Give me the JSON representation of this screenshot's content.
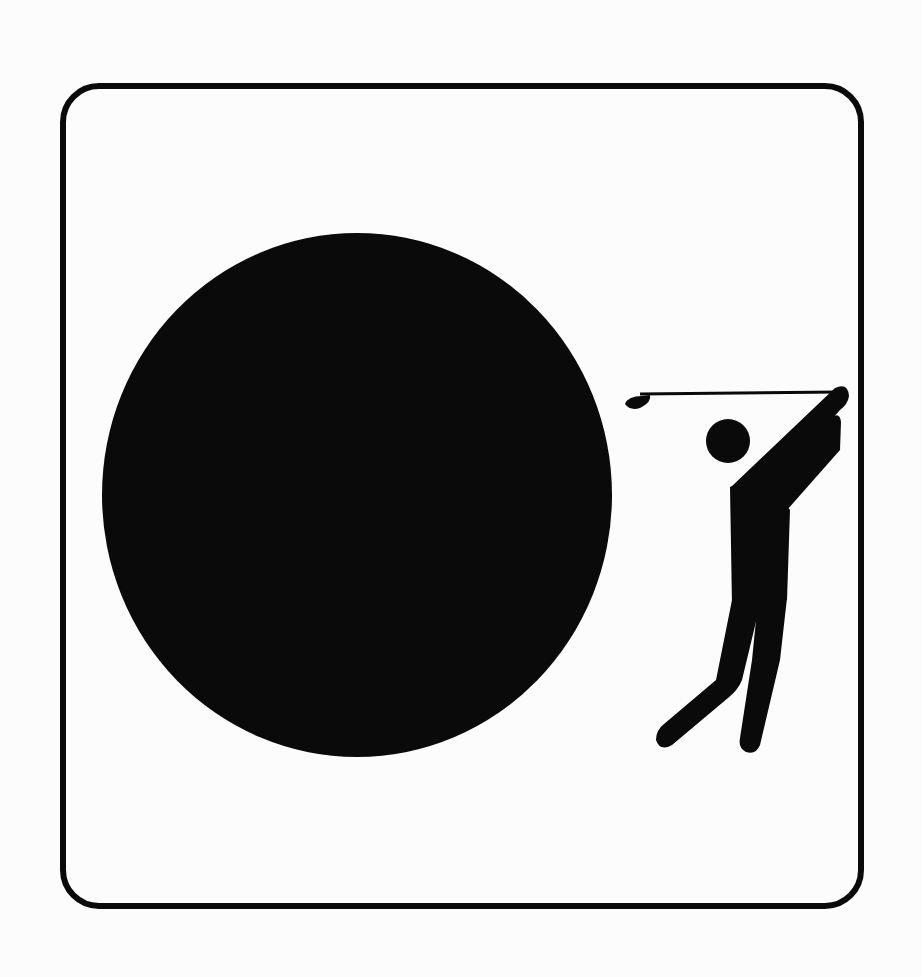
{
  "pictogram": {
    "subject": "golf",
    "elements": [
      "rounded-square-frame",
      "large-black-ball",
      "golfer-figure",
      "golf-club"
    ],
    "colors": {
      "ink": "#0a0a0a",
      "paper": "#fcfcfc"
    }
  }
}
